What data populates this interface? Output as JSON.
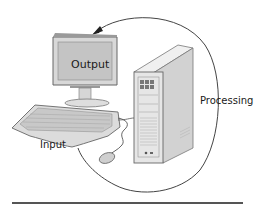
{
  "diagram": {
    "type": "computer-system-cycle",
    "labels": {
      "output": "Output",
      "processing": "Processing",
      "input": "Input"
    },
    "components": [
      "monitor",
      "system-unit-tower",
      "keyboard",
      "mouse"
    ],
    "cycle": {
      "direction": "Input -> Processing -> Output",
      "arrow_target": "monitor"
    },
    "colors": {
      "line": "#444444",
      "device_fill": "#e4e4e4",
      "device_stroke": "#6a6a6a",
      "screen_fill": "#c8c8c8",
      "rule": "#555555"
    }
  }
}
